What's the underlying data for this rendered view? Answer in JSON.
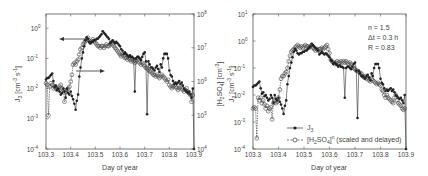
{
  "chart_data": [
    {
      "type": "line",
      "panel": "left",
      "xlabel": "Day of year",
      "ylabel": "J3 [cm^-3 s^-1]",
      "ylabel_right": "[H2SO4] [cm^-3]",
      "xlim": [
        103.3,
        103.9
      ],
      "ylim_log": [
        -4,
        0.47
      ],
      "ylim_right_log": [
        4,
        8
      ],
      "x_ticks": [
        "103.3",
        "103.4",
        "103.5",
        "103.6",
        "103.7",
        "103.8",
        "103.9"
      ],
      "y_ticks": [
        "10^0",
        "10^-1",
        "10^-2",
        "10^-3",
        "10^-4"
      ],
      "y_ticks_right": [
        "10^8",
        "10^7",
        "10^6",
        "10^5",
        "10^4"
      ],
      "annotations": [
        "arrow-left → J3 axis",
        "arrow-right → [H2SO4] axis"
      ],
      "series": [
        {
          "name": "J3",
          "marker": "filled-circle",
          "x": [
            103.3,
            103.305,
            103.31,
            103.315,
            103.32,
            103.325,
            103.33,
            103.335,
            103.34,
            103.345,
            103.35,
            103.355,
            103.36,
            103.365,
            103.37,
            103.375,
            103.38,
            103.385,
            103.39,
            103.395,
            103.4,
            103.405,
            103.41,
            103.415,
            103.42,
            103.425,
            103.43,
            103.435,
            103.44,
            103.445,
            103.45,
            103.455,
            103.46,
            103.465,
            103.47,
            103.475,
            103.48,
            103.485,
            103.49,
            103.495,
            103.5,
            103.505,
            103.51,
            103.515,
            103.52,
            103.525,
            103.53,
            103.535,
            103.54,
            103.545,
            103.55,
            103.555,
            103.56,
            103.565,
            103.57,
            103.575,
            103.58,
            103.585,
            103.59,
            103.595,
            103.6,
            103.605,
            103.61,
            103.615,
            103.62,
            103.625,
            103.63,
            103.635,
            103.64,
            103.645,
            103.65,
            103.655,
            103.66,
            103.665,
            103.67,
            103.675,
            103.68,
            103.685,
            103.69,
            103.695,
            103.7,
            103.705,
            103.71,
            103.715,
            103.72,
            103.725,
            103.73,
            103.735,
            103.74,
            103.745,
            103.75,
            103.755,
            103.76,
            103.765,
            103.77,
            103.775,
            103.78,
            103.785,
            103.79,
            103.795,
            103.8,
            103.805,
            103.81,
            103.815,
            103.82,
            103.825,
            103.83,
            103.835,
            103.84,
            103.845,
            103.85,
            103.855,
            103.86,
            103.865,
            103.87,
            103.875,
            103.88,
            103.885,
            103.89,
            103.895,
            103.9
          ],
          "log_y": [
            -1.7,
            -1.65,
            -1.65,
            -1.6,
            -1.55,
            -1.5,
            -1.75,
            -1.95,
            -1.9,
            -2.05,
            -2.0,
            -2.1,
            -2.2,
            -2.15,
            -2.0,
            -2.1,
            -2.3,
            -2.0,
            -2.15,
            -2.2,
            -2.1,
            -2.25,
            -2.35,
            -2.5,
            -2.7,
            -2.4,
            -2.2,
            -1.6,
            -1.3,
            -1.0,
            -0.8,
            -0.6,
            -0.4,
            -0.3,
            -0.35,
            -0.45,
            -0.5,
            -0.45,
            -0.45,
            -0.4,
            -0.4,
            -0.35,
            -0.35,
            -0.3,
            -0.25,
            -0.2,
            -0.1,
            -0.15,
            -0.2,
            -0.25,
            -0.3,
            -0.35,
            -0.5,
            -0.45,
            -0.4,
            -0.45,
            -0.5,
            -0.45,
            -0.5,
            -0.55,
            -0.6,
            -0.7,
            -0.75,
            -0.85,
            -0.8,
            -0.85,
            -0.9,
            -0.95,
            -0.9,
            -0.95,
            -0.95,
            -1.0,
            -2.1,
            -1.0,
            -0.95,
            -0.95,
            -1.0,
            -1.05,
            -0.95,
            -0.85,
            -0.8,
            -1.1,
            -2.85,
            -1.1,
            -1.2,
            -1.3,
            -1.3,
            -1.35,
            -1.4,
            -1.3,
            -1.25,
            -1.35,
            -1.45,
            -1.2,
            -1.3,
            -1.0,
            -0.85,
            -0.85,
            -0.85,
            -1.0,
            -1.4,
            -1.55,
            -1.6,
            -1.75,
            -1.85,
            -1.8,
            -1.85,
            -1.8,
            -1.75,
            -1.85,
            -1.8,
            -1.9,
            -2.0,
            -2.05,
            -2.1,
            -2.15,
            -2.1,
            -2.2,
            -2.3,
            -2.0,
            -4.0
          ]
        },
        {
          "name": "[H2SO4]",
          "marker": "open-circle",
          "x": [
            103.3,
            103.305,
            103.31,
            103.315,
            103.32,
            103.325,
            103.33,
            103.335,
            103.34,
            103.345,
            103.35,
            103.355,
            103.36,
            103.365,
            103.37,
            103.375,
            103.38,
            103.385,
            103.39,
            103.395,
            103.4,
            103.405,
            103.41,
            103.415,
            103.42,
            103.425,
            103.43,
            103.435,
            103.44,
            103.445,
            103.45,
            103.455,
            103.46,
            103.465,
            103.47,
            103.475,
            103.48,
            103.485,
            103.49,
            103.495,
            103.5,
            103.505,
            103.51,
            103.515,
            103.52,
            103.525,
            103.53,
            103.535,
            103.54,
            103.545,
            103.55,
            103.555,
            103.56,
            103.565,
            103.57,
            103.575,
            103.58,
            103.585,
            103.59,
            103.595,
            103.6,
            103.605,
            103.61,
            103.615,
            103.62,
            103.625,
            103.63,
            103.635,
            103.64,
            103.645,
            103.65,
            103.655,
            103.66,
            103.665,
            103.67,
            103.675,
            103.68,
            103.685,
            103.69,
            103.695,
            103.7,
            103.705,
            103.71,
            103.715,
            103.72,
            103.725,
            103.73,
            103.735,
            103.74,
            103.745,
            103.75,
            103.755,
            103.76,
            103.765,
            103.77,
            103.775,
            103.78,
            103.785,
            103.79,
            103.795,
            103.8,
            103.805,
            103.81,
            103.815,
            103.82,
            103.825,
            103.83,
            103.835,
            103.84,
            103.845,
            103.85,
            103.855,
            103.86,
            103.865,
            103.87,
            103.875,
            103.88,
            103.885,
            103.89,
            103.895
          ],
          "log_y": [
            5.95,
            5.9,
            5.0,
            5.85,
            5.95,
            5.9,
            5.8,
            5.85,
            5.8,
            5.75,
            5.8,
            5.85,
            5.9,
            5.8,
            5.75,
            5.4,
            5.7,
            5.75,
            5.8,
            5.85,
            6.0,
            6.2,
            6.5,
            6.55,
            6.5,
            6.6,
            6.65,
            6.8,
            6.95,
            7.0,
            7.1,
            7.15,
            7.2,
            7.25,
            7.3,
            7.2,
            7.15,
            7.2,
            7.25,
            7.2,
            7.15,
            7.1,
            7.05,
            7.05,
            7.0,
            7.05,
            7.05,
            7.0,
            7.05,
            7.1,
            7.05,
            7.05,
            7.1,
            7.15,
            7.1,
            7.05,
            7.0,
            6.95,
            6.9,
            6.85,
            6.8,
            6.75,
            6.8,
            6.75,
            6.7,
            6.7,
            6.65,
            6.7,
            6.65,
            6.6,
            6.65,
            6.6,
            6.55,
            6.6,
            6.65,
            6.6,
            6.55,
            6.5,
            6.55,
            6.5,
            6.45,
            6.4,
            6.4,
            6.35,
            6.3,
            6.3,
            6.25,
            6.2,
            6.2,
            6.15,
            6.2,
            6.15,
            6.1,
            6.15,
            6.2,
            6.15,
            6.1,
            6.05,
            6.0,
            6.05,
            5.9,
            5.85,
            5.8,
            5.85,
            5.9,
            5.85,
            5.8,
            5.75,
            5.8,
            5.85,
            5.8,
            5.75,
            5.7,
            5.75,
            5.8,
            5.7,
            5.65,
            5.6,
            5.4,
            5.6
          ]
        }
      ]
    },
    {
      "type": "line",
      "panel": "right",
      "xlabel": "Day of year",
      "ylabel": "J3 [cm^-3 s^-1]",
      "xlim": [
        103.3,
        103.9
      ],
      "ylim_log": [
        -4,
        1
      ],
      "x_ticks": [
        "103.3",
        "103.4",
        "103.5",
        "103.6",
        "103.7",
        "103.8",
        "103.9"
      ],
      "y_ticks": [
        "10^1",
        "10^0",
        "10^-1",
        "10^-2",
        "10^-3",
        "10^-4"
      ],
      "annotations": [
        "n = 1.5",
        "Δt = 0.3 h",
        "R = 0.83"
      ],
      "legend": [
        "J3",
        "[H2SO4]^n (scaled and delayed)"
      ],
      "series": [
        {
          "name": "J3",
          "marker": "filled-circle",
          "ref": "same as left panel J3"
        },
        {
          "name": "[H2SO4]^n (scaled and delayed)",
          "marker": "open-circle",
          "x": [
            103.3,
            103.305,
            103.31,
            103.315,
            103.32,
            103.325,
            103.33,
            103.335,
            103.34,
            103.345,
            103.35,
            103.355,
            103.36,
            103.365,
            103.37,
            103.375,
            103.38,
            103.385,
            103.39,
            103.395,
            103.4,
            103.405,
            103.41,
            103.415,
            103.42,
            103.425,
            103.43,
            103.435,
            103.44,
            103.445,
            103.45,
            103.455,
            103.46,
            103.465,
            103.47,
            103.475,
            103.48,
            103.485,
            103.49,
            103.495,
            103.5,
            103.505,
            103.51,
            103.515,
            103.52,
            103.525,
            103.53,
            103.535,
            103.54,
            103.545,
            103.55,
            103.555,
            103.56,
            103.565,
            103.57,
            103.575,
            103.58,
            103.585,
            103.59,
            103.595,
            103.6,
            103.605,
            103.61,
            103.615,
            103.62,
            103.625,
            103.63,
            103.635,
            103.64,
            103.645,
            103.65,
            103.655,
            103.66,
            103.665,
            103.67,
            103.675,
            103.68,
            103.685,
            103.69,
            103.695,
            103.7,
            103.705,
            103.71,
            103.715,
            103.72,
            103.725,
            103.73,
            103.735,
            103.74,
            103.745,
            103.75,
            103.755,
            103.76,
            103.765,
            103.77,
            103.775,
            103.78,
            103.785,
            103.79,
            103.795,
            103.8,
            103.805,
            103.81,
            103.815,
            103.82,
            103.825,
            103.83,
            103.835,
            103.84,
            103.845,
            103.85,
            103.855,
            103.86,
            103.865,
            103.87,
            103.875,
            103.88,
            103.885,
            103.89,
            103.895
          ],
          "log_y": [
            -2.5,
            -2.45,
            -2.5,
            -3.6,
            -2.1,
            -2.2,
            -2.1,
            -2.3,
            -2.2,
            -2.35,
            -2.5,
            -2.4,
            -2.6,
            -2.5,
            -2.45,
            -2.9,
            -2.3,
            -2.2,
            -2.3,
            -2.25,
            -2.1,
            -1.8,
            -1.4,
            -1.3,
            -1.3,
            -1.2,
            -1.15,
            -1.0,
            -0.75,
            -0.55,
            -0.4,
            -0.35,
            -0.3,
            -0.25,
            -0.2,
            -0.15,
            -0.2,
            -0.25,
            -0.2,
            -0.25,
            -0.2,
            -0.15,
            -0.2,
            -0.2,
            -0.25,
            -0.2,
            -0.15,
            -0.25,
            -0.3,
            -0.35,
            -0.3,
            -0.35,
            -0.3,
            -0.3,
            -0.25,
            -0.3,
            -0.25,
            -0.2,
            -0.15,
            -0.3,
            -0.45,
            -0.7,
            -0.75,
            -0.8,
            -0.85,
            -0.8,
            -0.75,
            -0.8,
            -0.8,
            -0.75,
            -0.8,
            -0.75,
            -0.8,
            -0.75,
            -0.8,
            -0.85,
            -0.8,
            -0.85,
            -0.95,
            -1.0,
            -1.05,
            -1.1,
            -1.1,
            -1.15,
            -1.2,
            -1.2,
            -1.3,
            -1.35,
            -1.3,
            -1.4,
            -1.35,
            -1.45,
            -1.5,
            -1.4,
            -1.45,
            -1.5,
            -1.55,
            -1.6,
            -1.55,
            -1.6,
            -1.65,
            -1.8,
            -1.85,
            -2.0,
            -2.1,
            -2.0,
            -2.1,
            -2.15,
            -2.2,
            -2.25,
            -2.3,
            -2.1,
            -2.0,
            -2.2,
            -2.3,
            -2.35,
            -2.4,
            -2.5,
            -2.55,
            -2.5
          ]
        }
      ]
    }
  ],
  "left": {
    "x_ticks": [
      "103.3",
      "103.4",
      "103.5",
      "103.6",
      "103.7",
      "103.8",
      "103.9"
    ],
    "y_ticks": [
      {
        "b": "10",
        "e": "0"
      },
      {
        "b": "10",
        "e": "-1"
      },
      {
        "b": "10",
        "e": "-2"
      },
      {
        "b": "10",
        "e": "-3"
      },
      {
        "b": "10",
        "e": "-4"
      }
    ],
    "y_ticks_right": [
      {
        "b": "10",
        "e": "8"
      },
      {
        "b": "10",
        "e": "7"
      },
      {
        "b": "10",
        "e": "6"
      },
      {
        "b": "10",
        "e": "5"
      },
      {
        "b": "10",
        "e": "4"
      }
    ],
    "xlabel": "Day of year",
    "ylabel": {
      "main": "J",
      "sub": "3",
      "unit": " [cm",
      "e1": "-3",
      "mid": " s",
      "e2": "-1",
      "end": "]"
    },
    "ylabel_right": {
      "pre": "[H",
      "sub1": "2",
      "mid": "SO",
      "sub2": "4",
      "post": "] [cm",
      "e": "-3",
      "end": "]"
    }
  },
  "right": {
    "x_ticks": [
      "103.3",
      "103.4",
      "103.5",
      "103.6",
      "103.7",
      "103.8",
      "103.9"
    ],
    "y_ticks": [
      {
        "b": "10",
        "e": "1"
      },
      {
        "b": "10",
        "e": "0"
      },
      {
        "b": "10",
        "e": "-1"
      },
      {
        "b": "10",
        "e": "-2"
      },
      {
        "b": "10",
        "e": "-3"
      },
      {
        "b": "10",
        "e": "-4"
      }
    ],
    "xlabel": "Day of year",
    "ylabel": {
      "main": "J",
      "sub": "3",
      "unit": " [cm",
      "e1": "-3",
      "mid": " s",
      "e2": "-1",
      "end": "]"
    },
    "annotation": {
      "line1": "n = 1.5",
      "line2": "Δt = 0.3 h",
      "line3": "R = 0.83"
    },
    "legend": {
      "item1": {
        "main": "J",
        "sub": "3"
      },
      "item2": {
        "pre": "[H",
        "sub1": "2",
        "mid": "SO",
        "sub2": "4",
        "post": "]",
        "sup": "n",
        "rest": " (scaled and delayed)"
      }
    }
  },
  "colors": {
    "line": "#333333",
    "axis": "#555555",
    "text": "#444444",
    "background": "#ffffff"
  }
}
